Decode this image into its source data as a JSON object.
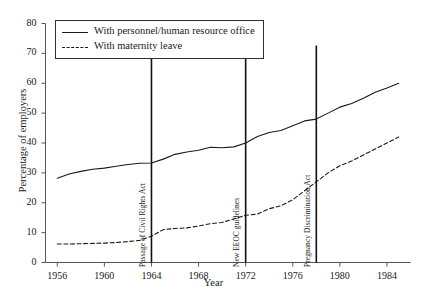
{
  "chart_data": {
    "type": "line",
    "title": "",
    "xlabel": "Year",
    "ylabel": "Percentage of employers",
    "xlim": [
      1955,
      1986
    ],
    "ylim": [
      0,
      80
    ],
    "grid": false,
    "legend_position": "top-left",
    "x_ticks": [
      1956,
      1960,
      1964,
      1968,
      1972,
      1976,
      1980,
      1984
    ],
    "y_ticks": [
      0,
      10,
      20,
      30,
      40,
      50,
      60,
      70,
      80
    ],
    "x": [
      1956,
      1957,
      1958,
      1959,
      1960,
      1961,
      1962,
      1963,
      1964,
      1965,
      1966,
      1967,
      1968,
      1969,
      1970,
      1971,
      1972,
      1973,
      1974,
      1975,
      1976,
      1977,
      1978,
      1979,
      1980,
      1981,
      1982,
      1983,
      1984,
      1985
    ],
    "series": [
      {
        "name": "With personnel/human resource office",
        "style": "solid",
        "values": [
          28.2,
          29.6,
          30.5,
          31.2,
          31.6,
          32.2,
          32.8,
          33.2,
          33.3,
          34.6,
          36.2,
          37.0,
          37.6,
          38.6,
          38.4,
          38.7,
          40.0,
          42.2,
          43.5,
          44.2,
          45.8,
          47.4,
          48.0,
          50.0,
          52.0,
          53.2,
          55.0,
          57.0,
          58.4,
          60.0
        ]
      },
      {
        "name": "With maternity leave",
        "style": "dashed",
        "values": [
          6.2,
          6.2,
          6.3,
          6.4,
          6.5,
          6.7,
          7.0,
          7.4,
          8.8,
          11.0,
          11.4,
          11.6,
          12.2,
          13.0,
          13.4,
          14.6,
          15.8,
          16.2,
          18.0,
          19.0,
          21.0,
          24.0,
          27.0,
          30.0,
          32.4,
          34.0,
          36.0,
          38.0,
          40.0,
          42.0
        ]
      }
    ],
    "annotations": [
      {
        "label": "Passage of Civil Rights Act",
        "year": 1964
      },
      {
        "label": "New EEOC guidelines",
        "year": 1972
      },
      {
        "label": "Pregnancy Discrimination Act",
        "year": 1978
      }
    ]
  },
  "legend": {
    "items": [
      {
        "label": "With personnel/human resource office",
        "style": "solid"
      },
      {
        "label": "With maternity leave",
        "style": "dashed"
      }
    ]
  },
  "colors": {
    "line": "#1a1a1a",
    "axis": "#555555",
    "background": "#ffffff"
  }
}
